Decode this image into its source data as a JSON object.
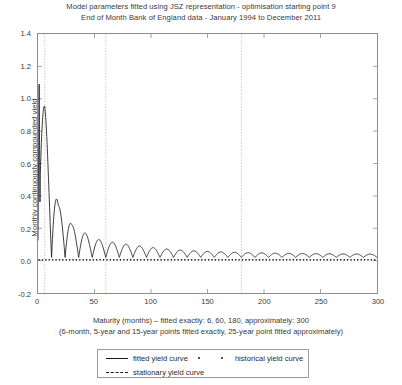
{
  "title": {
    "line1": "Model parameters fitted using JSZ representation - optimisation starting point 9",
    "line2": "End of Month Bank of England data - January 1994 to December 2011"
  },
  "caption": {
    "line1": "Maturity (months) – fitted exactly: 6, 60, 180, approximately: 300",
    "line2": "(6-month, 5-year and 15-year points fitted exactly, 25-year point fitted approximately)"
  },
  "axes": {
    "ylabel": "Monthly continuously compounded yield",
    "xlabel": "Maturity (months)",
    "yticks": [
      "-0.2",
      "0.0",
      "0.2",
      "0.4",
      "0.6",
      "0.8",
      "1.0",
      "1.2",
      "1.4"
    ],
    "xticks": [
      "0",
      "50",
      "100",
      "150",
      "200",
      "250",
      "300"
    ]
  },
  "legend": {
    "fitted": "fitted yield curve",
    "historical": "historical yield curve",
    "stationary": "stationary yield curve"
  },
  "colors": {
    "curve": "#1a1a1a",
    "axis": "#8d8d8d",
    "grid": "#bdbdbd",
    "text": "#3a3a3a"
  },
  "chart_data": {
    "type": "line",
    "title": "Model parameters fitted using JSZ representation - optimisation starting point 9",
    "subtitle": "End of Month Bank of England data - January 1994 to December 2011",
    "xlabel": "Maturity (months)",
    "ylabel": "Monthly continuously compounded yield",
    "xlim": [
      0,
      300
    ],
    "ylim": [
      -0.2,
      1.4
    ],
    "xtick_values": [
      0,
      50,
      100,
      150,
      200,
      250,
      300
    ],
    "ytick_values": [
      -0.2,
      0.0,
      0.2,
      0.4,
      0.6,
      0.8,
      1.0,
      1.2,
      1.4
    ],
    "grid": false,
    "legend_position": "below-axes",
    "exact_fit_maturities": [
      6,
      60,
      180
    ],
    "approx_fit_maturities": [
      300
    ],
    "stationary_lines_x": [
      6,
      60,
      180
    ],
    "series": [
      {
        "name": "fitted yield curve",
        "style": "solid",
        "note": "strongly damped oscillatory curve, period ~12 months, decaying envelope toward ~0.02",
        "oscillation_period_months": 12,
        "initial_peak": 1.07,
        "asymptote": 0.02,
        "envelope_points": [
          {
            "x": 1,
            "amplitude": 1.07
          },
          {
            "x": 6,
            "amplitude": 0.95
          },
          {
            "x": 12,
            "amplitude": 0.62
          },
          {
            "x": 18,
            "amplitude": 0.34
          },
          {
            "x": 24,
            "amplitude": 0.33
          },
          {
            "x": 30,
            "amplitude": 0.22
          },
          {
            "x": 36,
            "amplitude": 0.2
          },
          {
            "x": 48,
            "amplitude": 0.14
          },
          {
            "x": 60,
            "amplitude": 0.12
          },
          {
            "x": 84,
            "amplitude": 0.095
          },
          {
            "x": 108,
            "amplitude": 0.075
          },
          {
            "x": 132,
            "amplitude": 0.062
          },
          {
            "x": 156,
            "amplitude": 0.055
          },
          {
            "x": 180,
            "amplitude": 0.05
          },
          {
            "x": 220,
            "amplitude": 0.045
          },
          {
            "x": 260,
            "amplitude": 0.042
          },
          {
            "x": 300,
            "amplitude": 0.04
          }
        ]
      },
      {
        "name": "historical yield curve",
        "style": "dots",
        "note": "dotted markers tracking very close to zero across all maturities",
        "level": 0.005
      },
      {
        "name": "stationary yield curve",
        "style": "dashed-vertical",
        "note": "vertical dotted reference lines at exactly-fitted maturities"
      }
    ]
  }
}
